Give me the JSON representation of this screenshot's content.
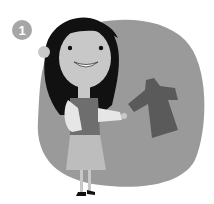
{
  "badge": {
    "number": "1"
  },
  "illustration": {
    "subject": "girl holding a coat",
    "colors": {
      "background_blob": "#9a9a9a",
      "hair": "#111111",
      "skin": "#c8c8c8",
      "coat": "#5a5a5a",
      "skirt": "#bdbdbd",
      "scarf": "#e6e6e6"
    }
  }
}
